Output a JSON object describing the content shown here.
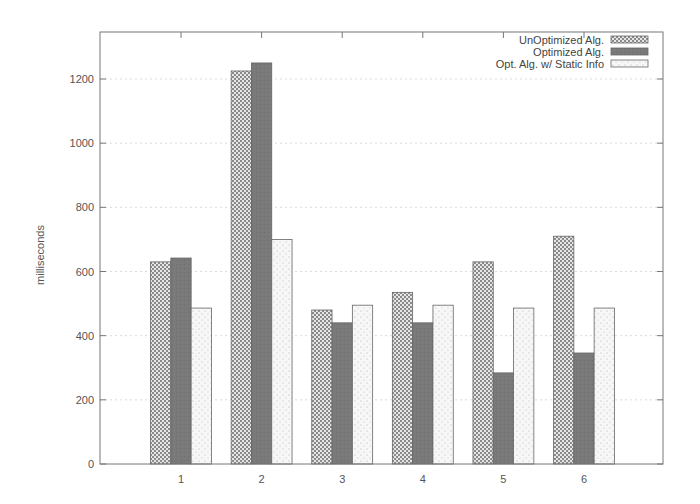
{
  "chart_data": {
    "type": "bar",
    "title": "",
    "xlabel": "",
    "ylabel": "milliseconds",
    "categories": [
      "1",
      "2",
      "3",
      "4",
      "5",
      "6"
    ],
    "series": [
      {
        "name": "UnOptimized Alg.",
        "values": [
          630,
          1225,
          480,
          535,
          630,
          710
        ],
        "pattern": "checker"
      },
      {
        "name": "Optimized Alg.",
        "values": [
          642,
          1250,
          440,
          440,
          284,
          346
        ],
        "pattern": "solid-dark"
      },
      {
        "name": "Opt. Alg. w/ Static Info",
        "values": [
          486,
          700,
          495,
          495,
          486,
          486
        ],
        "pattern": "sparse-dots"
      }
    ],
    "ylim": [
      0,
      1300
    ],
    "yticks": [
      0,
      200,
      400,
      600,
      800,
      1000,
      1200
    ],
    "grid": true,
    "legend_position": "top-right"
  },
  "colors": {
    "frame": "#777777",
    "grid": "#cccccc",
    "dark_bar": "#7a7a7a",
    "checker_bar": "#9a9a9a",
    "light_bar": "#f4f4f4"
  }
}
